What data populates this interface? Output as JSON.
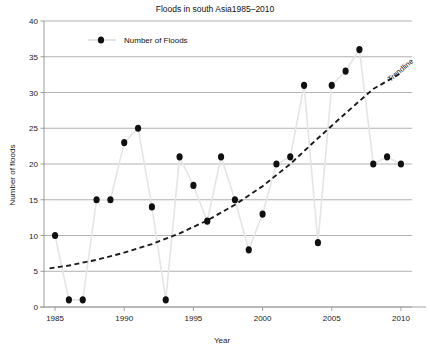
{
  "chart_data": {
    "type": "scatter",
    "title": "Floods in south Asia1985–2010",
    "xlabel": "Year",
    "ylabel": "Number of floods",
    "xlim": [
      1984.2,
      2010.8
    ],
    "ylim": [
      0,
      40
    ],
    "xticks": [
      1985,
      1990,
      1995,
      2000,
      2005,
      2010
    ],
    "xticklabels": [
      "1985",
      "1990",
      "1995",
      "2000",
      "2005",
      "2010"
    ],
    "yticks": [
      0,
      5,
      10,
      15,
      20,
      25,
      30,
      35,
      40
    ],
    "yticklabels": [
      "0",
      "5",
      "10",
      "15",
      "20",
      "25",
      "30",
      "35",
      "40"
    ],
    "grid": "horizontal",
    "legend": {
      "position": "top-left-inside",
      "entries": [
        {
          "label": "Number of Floods",
          "marker": "circle",
          "marker_color": "#101010",
          "line_color": "#e2e2e2"
        }
      ]
    },
    "annotations": [
      {
        "text": "Trendline",
        "rotation": -40,
        "x_px": 402,
        "y_px": 72
      }
    ],
    "series": [
      {
        "name": "Number of Floods",
        "marker": "circle",
        "marker_color": "#101010",
        "connector_line_color": "#e5e5e5",
        "x": [
          1985,
          1986,
          1987,
          1988,
          1989,
          1990,
          1991,
          1992,
          1993,
          1994,
          1995,
          1996,
          1997,
          1998,
          1999,
          2000,
          2001,
          2002,
          2003,
          2004,
          2005,
          2006,
          2007,
          2008,
          2009,
          2010
        ],
        "values": [
          10,
          1,
          1,
          15,
          15,
          23,
          25,
          14,
          1,
          21,
          17,
          12,
          21,
          15,
          8,
          13,
          20,
          21,
          31,
          9,
          31,
          33,
          36,
          20,
          21,
          20
        ]
      }
    ],
    "trendline": {
      "label": "Trendline",
      "style": "dashed",
      "color": "#1a1a1a",
      "type": "exponential",
      "x": [
        1984.6,
        1986,
        1988,
        1990,
        1992,
        1994,
        1996,
        1998,
        2000,
        2002,
        2004,
        2006,
        2008,
        2009.9
      ],
      "y": [
        5.4,
        5.8,
        6.6,
        7.6,
        8.8,
        10.3,
        12.1,
        14.3,
        16.9,
        20.0,
        23.6,
        27.1,
        30.5,
        32.6
      ]
    }
  }
}
